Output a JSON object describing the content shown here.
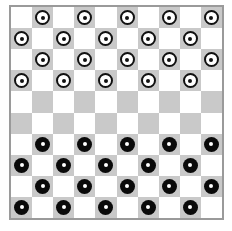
{
  "game": "draughts",
  "board": {
    "size": 10,
    "colors": {
      "dark": "#c9c9c9",
      "light": "#ffffff",
      "border": "#9a9a9a"
    },
    "rows": [
      ".w.w.w.w.w",
      "w.w.w.w.w.",
      ".w.w.w.w.w",
      "w.w.w.w.w.",
      "..........",
      "..........",
      ".b.b.b.b.b",
      "b.b.b.b.b.",
      ".b.b.b.b.b",
      "b.b.b.b.b."
    ]
  },
  "pieces": {
    "white_count": 20,
    "black_count": 20
  }
}
